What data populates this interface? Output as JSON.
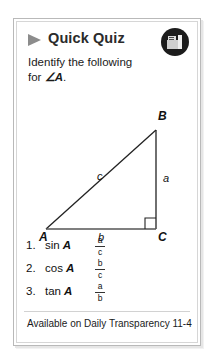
{
  "card": {
    "header": {
      "title": "Quick Quiz",
      "bullet_icon": "play-triangle-icon",
      "badge_icon": "book-icon"
    },
    "prompt": {
      "line1": "Identify the following",
      "line2_prefix": "for ",
      "line2_angle": "∠A",
      "line2_suffix": "."
    },
    "figure": {
      "type": "right-triangle",
      "vertices": {
        "A": "A",
        "B": "B",
        "C": "C"
      },
      "sides": {
        "hypotenuse": "c",
        "opposite": "a",
        "adjacent": "b"
      },
      "right_angle_at": "C"
    },
    "items": [
      {
        "number": "1.",
        "function": "sin",
        "angle": "A",
        "numerator": "a",
        "denominator": "c"
      },
      {
        "number": "2.",
        "function": "cos",
        "angle": "A",
        "numerator": "b",
        "denominator": "c"
      },
      {
        "number": "3.",
        "function": "tan",
        "angle": "A",
        "numerator": "a",
        "denominator": "b"
      }
    ],
    "footer": {
      "text": "Available on Daily Transparency 11-4"
    }
  },
  "colors": {
    "card_border": "#b9b9b9",
    "inner_border": "#d6d6d6",
    "bullet": "#8c8c8c",
    "badge_bg": "#1c1c1c",
    "text": "#1a1a1a",
    "divider": "#d2d2d2"
  }
}
